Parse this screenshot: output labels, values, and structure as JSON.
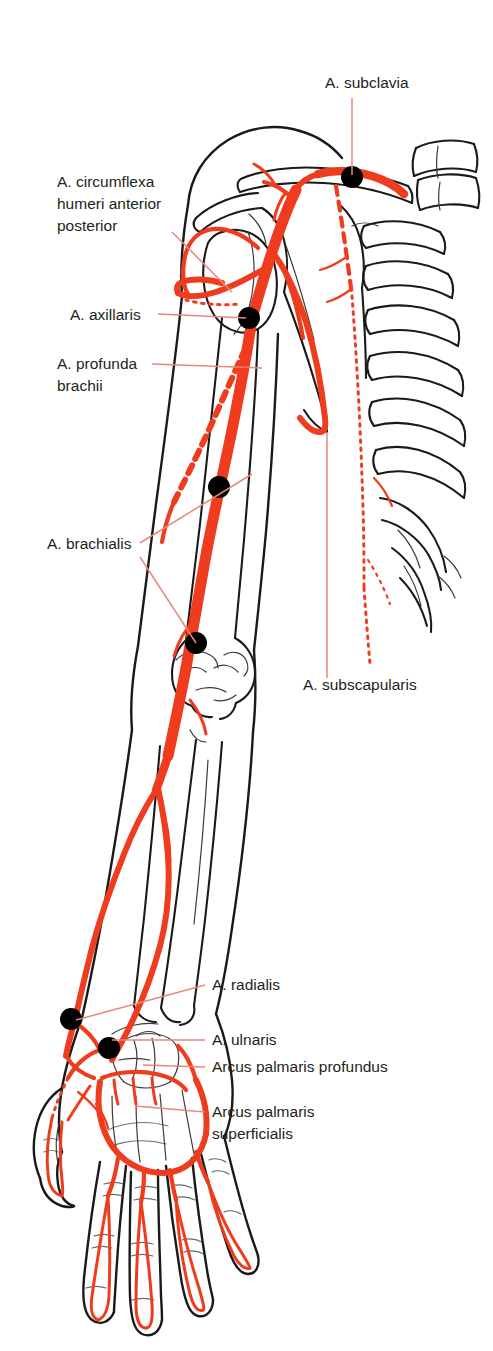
{
  "figure": {
    "background_color": "#ffffff",
    "artery_color": "#F03C1E",
    "leader_line_color": "#E8877A",
    "outline_color": "#1a1a1a",
    "marker_color": "#000000",
    "label_text_color": "#231f20"
  },
  "labels": [
    {
      "id": "a-subclavia",
      "name": "A. subclavia",
      "lines": [
        "A. subclavia"
      ],
      "align": "start",
      "text_x": 325,
      "text_y": 88,
      "leader": "M 352,98 L 352,175"
    },
    {
      "id": "a-circumflexa-humeri",
      "name": "A. circumflexa humeri anterior posterior",
      "lines": [
        "A. circumflexa",
        "humeri anterior",
        "posterior"
      ],
      "align": "start",
      "text_x": 57,
      "text_y": 187,
      "leader": "M 172,232 L 232,290"
    },
    {
      "id": "a-axillaris",
      "name": "A. axillaris",
      "lines": [
        "A. axillaris"
      ],
      "align": "start",
      "text_x": 70,
      "text_y": 320,
      "leader": "M 158,314 L 246,318"
    },
    {
      "id": "a-profunda-brachii",
      "name": "A. profunda brachii",
      "lines": [
        "A. profunda",
        "brachii"
      ],
      "align": "start",
      "text_x": 57,
      "text_y": 369,
      "leader": "M 152,364 L 262,368"
    },
    {
      "id": "a-brachialis",
      "name": "A. brachialis",
      "lines": [
        "A. brachialis"
      ],
      "align": "start",
      "text_x": 47,
      "text_y": 549,
      "leader_a": "M 140,543 L 252,474",
      "leader_b": "M 140,557 L 196,643"
    },
    {
      "id": "a-subscapularis",
      "name": "A. subscapularis",
      "lines": [
        "A. subscapularis"
      ],
      "align": "start",
      "text_x": 303,
      "text_y": 690,
      "leader": "M 327,678 L 327,432"
    },
    {
      "id": "a-radialis",
      "name": "A. radialis",
      "lines": [
        "A. radialis"
      ],
      "align": "start",
      "text_x": 212,
      "text_y": 990,
      "leader": "M 205,985 L 76,1020"
    },
    {
      "id": "a-ulnaris",
      "name": "A. ulnaris",
      "lines": [
        "A. ulnaris"
      ],
      "align": "start",
      "text_x": 212,
      "text_y": 1045,
      "leader": "M 205,1040 L 112,1040"
    },
    {
      "id": "arcus-palmaris-profundus",
      "name": "Arcus palmaris profundus",
      "lines": [
        "Arcus palmaris profundus"
      ],
      "align": "start",
      "text_x": 212,
      "text_y": 1072,
      "leader": "M 205,1067 L 143,1065"
    },
    {
      "id": "arcus-palmaris-superficialis",
      "name": "Arcus palmaris superficialis",
      "lines": [
        "Arcus palmaris",
        "superficialis"
      ],
      "align": "start",
      "text_x": 212,
      "text_y": 1117,
      "leader": "M 205,1112 L 135,1106"
    }
  ],
  "markers": [
    {
      "id": "marker-subclavia",
      "name": "A. subclavia pulse point",
      "cx": 352,
      "cy": 177,
      "r": 11
    },
    {
      "id": "marker-axillaris",
      "name": "A. axillaris pulse point",
      "cx": 249,
      "cy": 318,
      "r": 11
    },
    {
      "id": "marker-brachialis-upper",
      "name": "A. brachialis upper pulse point",
      "cx": 219,
      "cy": 487,
      "r": 11
    },
    {
      "id": "marker-brachialis-lower",
      "name": "A. brachialis cubital pulse point",
      "cx": 196,
      "cy": 643,
      "r": 11
    },
    {
      "id": "marker-radialis",
      "name": "A. radialis pulse point",
      "cx": 71,
      "cy": 1019,
      "r": 11
    },
    {
      "id": "marker-ulnaris",
      "name": "A. ulnaris pulse point",
      "cx": 109,
      "cy": 1048,
      "r": 11
    }
  ],
  "structures": {
    "skeleton_visible": [
      "clavicle",
      "scapula",
      "humerus",
      "ribs",
      "vertebrae",
      "sternum",
      "radius",
      "ulna",
      "carpals",
      "metacarpals",
      "phalanges"
    ],
    "arteries_drawn": [
      "A. subclavia",
      "A. axillaris",
      "A. circumflexa humeri anterior",
      "A. circumflexa humeri posterior",
      "A. subscapularis",
      "A. thoracica interna",
      "A. profunda brachii",
      "A. brachialis",
      "A. radialis",
      "A. ulnaris",
      "Arcus palmaris profundus",
      "Arcus palmaris superficialis",
      "Aa. digitales palmares"
    ]
  }
}
